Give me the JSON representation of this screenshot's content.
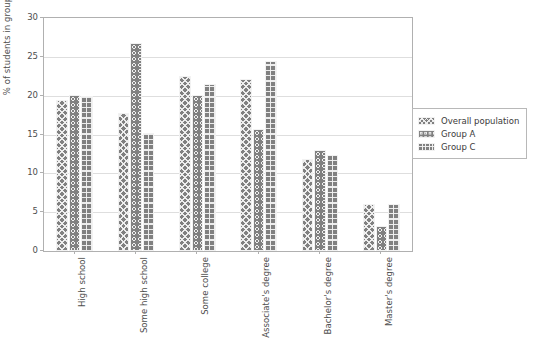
{
  "chart_data": {
    "type": "bar",
    "title": "",
    "xlabel": "",
    "ylabel": "% of students in group",
    "ylim": [
      0,
      30
    ],
    "yticks": [
      0,
      5,
      10,
      15,
      20,
      25,
      30
    ],
    "ytick_labels": [
      "0",
      "5",
      "10",
      "15",
      "20",
      "25",
      "30"
    ],
    "grid": true,
    "legend_position": "right",
    "bar_color": "#808080",
    "hatch_color": "#f2f2f2",
    "gridline_color": "#dedede",
    "axis_color": "#b0b0b0",
    "categories": [
      "High school",
      "Some high school",
      "Some college",
      "Associate's degree",
      "Bachelor's degree",
      "Master's degree"
    ],
    "series": [
      {
        "name": "Overall population",
        "hatch": "x-cross",
        "values": [
          19.5,
          17.8,
          22.5,
          22.2,
          11.8,
          6.0
        ]
      },
      {
        "name": "Group A",
        "hatch": "circles",
        "values": [
          20.1,
          26.8,
          20.1,
          15.7,
          13.0,
          3.2
        ]
      },
      {
        "name": "Group C",
        "hatch": "grid",
        "values": [
          19.9,
          15.2,
          21.5,
          24.5,
          12.4,
          6.0
        ]
      }
    ]
  },
  "legend": {
    "entries": [
      {
        "label": "Overall population"
      },
      {
        "label": "Group A"
      },
      {
        "label": "Group C"
      }
    ]
  }
}
